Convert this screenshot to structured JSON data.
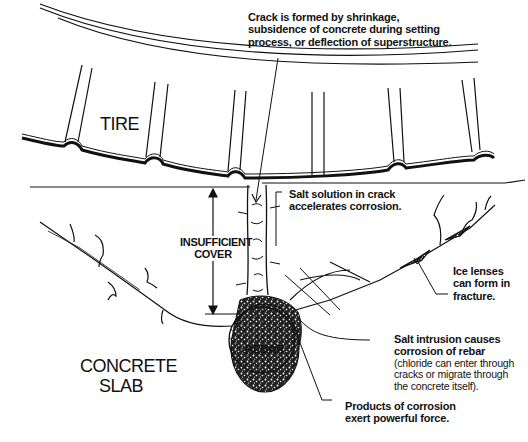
{
  "diagram": {
    "title": "",
    "labels": {
      "tire": "TIRE",
      "concrete_slab": [
        "CONCRETE",
        "SLAB"
      ],
      "rebar": "REBAR",
      "insufficient_cover": [
        "INSUFFICIENT",
        "COVER"
      ]
    },
    "callouts": {
      "crack_formed": [
        "Crack is formed by shrinkage,",
        "subsidence of concrete during setting",
        "process, or deflection of superstructure."
      ],
      "salt_solution": [
        "Salt solution in crack",
        "accelerates corrosion."
      ],
      "ice_lenses": [
        "Ice lenses",
        "can form in",
        "fracture."
      ],
      "salt_intrusion": {
        "heading": [
          "Salt intrusion causes",
          "corrosion of rebar"
        ],
        "detail": [
          "(chloride can enter through",
          "cracks or migrate through",
          "the concrete itself)."
        ]
      },
      "products_corrosion": [
        "Products of corrosion",
        "exert powerful force."
      ]
    },
    "colors": {
      "ink": "#111111",
      "background": "#ffffff"
    }
  }
}
